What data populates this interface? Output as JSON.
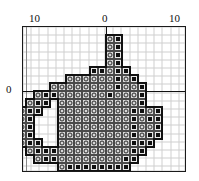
{
  "figure": {
    "kind": "cross-stitch-pattern-chart",
    "background_color": "#ffffff",
    "frame_color": "#1a1a1a",
    "grid_minor_color": "#cfcfcf",
    "grid_major_color": "#8a8a8a",
    "axis_color": "#111111"
  },
  "axes": {
    "x_ticks": [
      {
        "id": "x-left",
        "label": "10",
        "value": -10
      },
      {
        "id": "x-zero",
        "label": "0",
        "value": 0
      },
      {
        "id": "x-right",
        "label": "10",
        "value": 10
      }
    ],
    "y_ticks": [
      {
        "id": "y-zero",
        "label": "0",
        "value": 0
      }
    ],
    "xlim": [
      -13,
      7
    ],
    "ylim": [
      -10,
      8
    ],
    "cell_size_px": 8,
    "origin_px": {
      "x": 83,
      "y": 64
    }
  },
  "legend": {
    "symbols": [
      {
        "id": "light-ring",
        "name": "ring-symbol",
        "fill": "#d7d7d7",
        "mark": "ring"
      },
      {
        "id": "dark-block",
        "name": "block-symbol",
        "fill": "#e8e8e8",
        "mark": "filled-square"
      }
    ]
  },
  "chart_data": {
    "type": "heatmap",
    "title": "",
    "xlabel": "",
    "ylabel": "",
    "xlim": [
      -13,
      7
    ],
    "ylim": [
      -10,
      8
    ],
    "grid": true,
    "legend_position": "none",
    "symbol_values": {
      "0": "empty",
      "1": "light-ring",
      "2": "dark-block"
    },
    "categories": [
      "-13",
      "-12",
      "-11",
      "-10",
      "-9",
      "-8",
      "-7",
      "-6",
      "-5",
      "-4",
      "-3",
      "-2",
      "-1",
      "0",
      "1",
      "2",
      "3",
      "4",
      "5",
      "6"
    ],
    "rows": [
      {
        "y": 7,
        "cells": [
          0,
          0,
          0,
          0,
          0,
          0,
          0,
          0,
          0,
          0,
          0,
          0,
          0,
          1,
          2,
          0,
          0,
          0,
          0,
          0
        ]
      },
      {
        "y": 6,
        "cells": [
          0,
          0,
          0,
          0,
          0,
          0,
          0,
          0,
          0,
          0,
          0,
          0,
          0,
          1,
          2,
          0,
          0,
          0,
          0,
          0
        ]
      },
      {
        "y": 5,
        "cells": [
          0,
          0,
          0,
          0,
          0,
          0,
          0,
          0,
          0,
          0,
          0,
          0,
          0,
          1,
          2,
          0,
          0,
          0,
          0,
          0
        ]
      },
      {
        "y": 4,
        "cells": [
          0,
          0,
          0,
          0,
          0,
          0,
          0,
          0,
          0,
          0,
          0,
          0,
          0,
          1,
          2,
          0,
          0,
          0,
          0,
          0
        ]
      },
      {
        "y": 3,
        "cells": [
          0,
          0,
          0,
          0,
          0,
          0,
          0,
          0,
          0,
          0,
          0,
          2,
          2,
          1,
          2,
          2,
          0,
          0,
          0,
          0
        ]
      },
      {
        "y": 2,
        "cells": [
          0,
          0,
          0,
          0,
          0,
          0,
          0,
          0,
          1,
          1,
          1,
          1,
          1,
          1,
          2,
          1,
          2,
          0,
          0,
          0
        ]
      },
      {
        "y": 1,
        "cells": [
          0,
          0,
          0,
          0,
          0,
          0,
          1,
          1,
          1,
          1,
          1,
          1,
          1,
          1,
          2,
          1,
          1,
          2,
          0,
          0
        ]
      },
      {
        "y": 0,
        "cells": [
          0,
          0,
          0,
          0,
          1,
          2,
          2,
          1,
          1,
          1,
          1,
          1,
          1,
          2,
          1,
          1,
          1,
          2,
          0,
          0
        ]
      },
      {
        "y": -1,
        "cells": [
          0,
          0,
          0,
          1,
          2,
          2,
          0,
          1,
          1,
          1,
          1,
          1,
          1,
          1,
          1,
          1,
          1,
          2,
          0,
          0
        ]
      },
      {
        "y": -2,
        "cells": [
          0,
          0,
          1,
          2,
          2,
          0,
          0,
          1,
          1,
          1,
          1,
          1,
          1,
          1,
          1,
          1,
          2,
          2,
          1,
          2
        ]
      },
      {
        "y": -3,
        "cells": [
          0,
          0,
          1,
          2,
          0,
          0,
          0,
          1,
          1,
          1,
          1,
          1,
          1,
          1,
          1,
          1,
          2,
          1,
          2,
          2
        ]
      },
      {
        "y": -4,
        "cells": [
          0,
          0,
          1,
          2,
          0,
          0,
          0,
          1,
          1,
          1,
          1,
          1,
          1,
          1,
          1,
          1,
          2,
          1,
          1,
          2
        ]
      },
      {
        "y": -5,
        "cells": [
          0,
          0,
          1,
          2,
          0,
          0,
          0,
          1,
          1,
          1,
          1,
          1,
          1,
          1,
          1,
          1,
          2,
          1,
          2,
          2
        ]
      },
      {
        "y": -6,
        "cells": [
          0,
          0,
          1,
          2,
          2,
          0,
          0,
          1,
          1,
          1,
          1,
          1,
          1,
          1,
          1,
          1,
          2,
          2,
          2,
          0
        ]
      },
      {
        "y": -7,
        "cells": [
          0,
          0,
          0,
          1,
          2,
          2,
          2,
          1,
          1,
          1,
          1,
          1,
          1,
          1,
          1,
          1,
          2,
          2,
          0,
          0
        ]
      },
      {
        "y": -8,
        "cells": [
          0,
          0,
          0,
          0,
          1,
          2,
          2,
          1,
          1,
          1,
          1,
          1,
          1,
          1,
          1,
          2,
          2,
          0,
          0,
          0
        ]
      },
      {
        "y": -9,
        "cells": [
          0,
          0,
          0,
          0,
          0,
          0,
          0,
          1,
          2,
          2,
          2,
          2,
          2,
          2,
          2,
          2,
          0,
          0,
          0,
          0
        ]
      }
    ]
  }
}
